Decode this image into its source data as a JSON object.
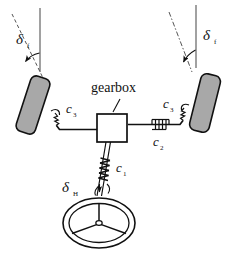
{
  "figure": {
    "type": "mechanical-schematic",
    "background_color": "#ffffff",
    "line_color": "#111111",
    "tire_fill_color": "#a8a8a8",
    "tire_stroke_color": "#111111",
    "gearbox_fill_color": "#ffffff",
    "reference_line_color": "#7a7a7a"
  },
  "labels": {
    "gearbox": "gearbox",
    "delta_front_left": {
      "symbol": "δ",
      "subscript": "f"
    },
    "delta_front_right": {
      "symbol": "δ",
      "subscript": "f"
    },
    "delta_handwheel": {
      "symbol": "δ",
      "subscript": "H"
    },
    "stiffness_c1": {
      "symbol": "c",
      "subscript": "1"
    },
    "stiffness_c2": {
      "symbol": "c",
      "subscript": "2"
    },
    "stiffness_c3_left": {
      "symbol": "c",
      "subscript": "3"
    },
    "stiffness_c3_right": {
      "symbol": "c",
      "subscript": "3"
    }
  },
  "components": {
    "left_wheel": "left-front-tire",
    "right_wheel": "right-front-tire",
    "gearbox": "steering-gearbox",
    "steering_wheel": "hand-steering-wheel",
    "tie_rod_left": "left-tie-rod",
    "tie_rod_right": "right-tie-rod",
    "steering_column": "steering-column",
    "spring_c1": "column-torsion-spring",
    "spring_c2": "tie-rod-spring",
    "spring_c3_left": "left-kingpin-spring",
    "spring_c3_right": "right-kingpin-spring",
    "vertical_reference_left": "left-vertical-reference-line",
    "vertical_reference_right": "right-vertical-reference-line",
    "wheel_axis_left": "left-wheel-axis-dashed",
    "wheel_axis_right": "right-wheel-axis-dashed",
    "angle_arc_left": "left-steer-angle-arc",
    "angle_arc_right": "right-steer-angle-arc",
    "angle_arc_handwheel": "handwheel-angle-arc"
  }
}
